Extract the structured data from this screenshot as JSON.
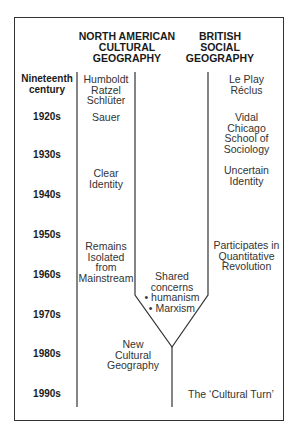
{
  "headers": {
    "north_american": [
      "NORTH AMERICAN",
      "CULTURAL",
      "GEOGRAPHY"
    ],
    "british": [
      "BRITISH",
      "SOCIAL",
      "GEOGRAPHY"
    ]
  },
  "periods": [
    [
      "Nineteenth",
      "century"
    ],
    "1920s",
    "1930s",
    "1940s",
    "1950s",
    "1960s",
    "1970s",
    "1980s",
    "1990s"
  ],
  "north_american_entries": {
    "nineteenth": [
      "Humboldt",
      "Ratzel",
      "Schlüter"
    ],
    "1920s": "Sauer",
    "clear_identity": [
      "Clear",
      "Identity"
    ],
    "isolated": [
      "Remains",
      "Isolated",
      "from",
      "Mainstream"
    ],
    "new_cultural": [
      "New",
      "Cultural",
      "Geography"
    ]
  },
  "british_entries": {
    "nineteenth": [
      "Le Play",
      "Réclus"
    ],
    "1920s": [
      "Vidal",
      "Chicago",
      "School of",
      "Sociology"
    ],
    "uncertain": [
      "Uncertain",
      "Identity"
    ],
    "quantitative": [
      "Participates in",
      "Quantitative",
      "Revolution"
    ],
    "cultural_turn": "The ‘Cultural Turn’"
  },
  "shared": [
    "Shared",
    "concerns",
    "• humanism",
    "• Marxism"
  ]
}
